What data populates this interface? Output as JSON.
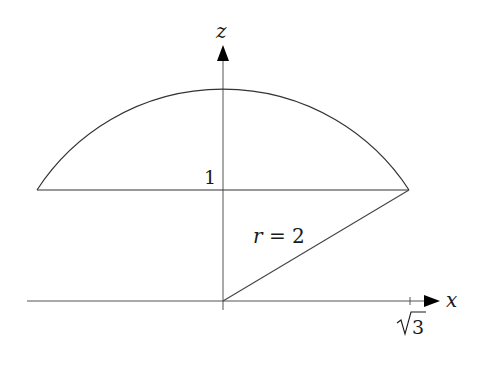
{
  "diagram": {
    "axes": {
      "z_label": "z",
      "x_label": "x"
    },
    "labels": {
      "height_value": "1",
      "radius_label": "r = 2",
      "x_tick_label": "√3",
      "x_tick_radicand": "3"
    },
    "geometry": {
      "radius": 2,
      "chord_height": 1,
      "chord_half_width": "√3"
    },
    "colors": {
      "stroke": "#333333",
      "arrow": "#000000",
      "background": "#ffffff"
    }
  }
}
